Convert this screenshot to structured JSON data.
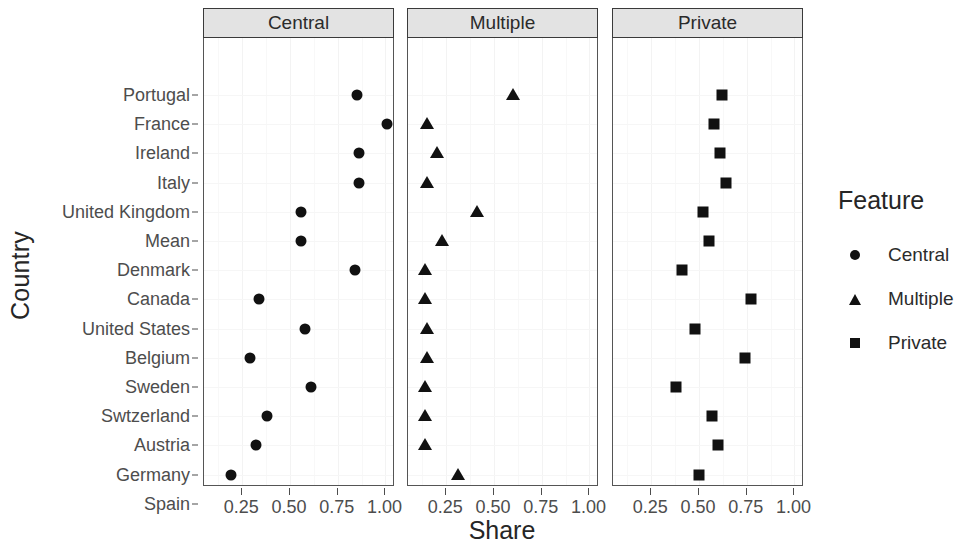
{
  "chart_data": {
    "type": "scatter",
    "title": "",
    "xlabel": "Share",
    "ylabel": "Country",
    "xlim": [
      0.05,
      1.05
    ],
    "xticks": [
      0.25,
      0.5,
      0.75,
      1.0
    ],
    "xtick_labels": [
      "0.25",
      "0.50",
      "0.75",
      "1.00"
    ],
    "grid": true,
    "legend_title": "Feature",
    "legend_position": "right",
    "facet_labels": [
      "Central",
      "Multiple",
      "Private"
    ],
    "categories": [
      "Portugal",
      "France",
      "Ireland",
      "Italy",
      "United Kingdom",
      "Mean",
      "Denmark",
      "Canada",
      "United States",
      "Belgium",
      "Sweden",
      "Swtzerland",
      "Austria",
      "Germany",
      "Spain"
    ],
    "series": [
      {
        "name": "Central",
        "marker": "circle",
        "values": [
          0.85,
          1.01,
          0.86,
          0.86,
          0.56,
          0.56,
          0.84,
          0.34,
          0.58,
          0.29,
          0.61,
          0.38,
          0.32,
          0.19,
          0.1
        ]
      },
      {
        "name": "Multiple",
        "marker": "triangle",
        "values": [
          0.6,
          0.15,
          0.2,
          0.15,
          0.41,
          0.23,
          0.14,
          0.14,
          0.15,
          0.15,
          0.14,
          0.14,
          0.14,
          0.31,
          0.21
        ]
      },
      {
        "name": "Private",
        "marker": "square",
        "values": [
          0.62,
          0.58,
          0.61,
          0.64,
          0.52,
          0.55,
          0.41,
          0.77,
          0.48,
          0.74,
          0.38,
          0.57,
          0.6,
          0.5,
          0.61
        ]
      }
    ]
  },
  "legend": {
    "title": "Feature",
    "entries": [
      {
        "label": "Central",
        "marker": "circle"
      },
      {
        "label": "Multiple",
        "marker": "triangle"
      },
      {
        "label": "Private",
        "marker": "square"
      }
    ]
  },
  "axes": {
    "x_title": "Share",
    "y_title": "Country"
  }
}
